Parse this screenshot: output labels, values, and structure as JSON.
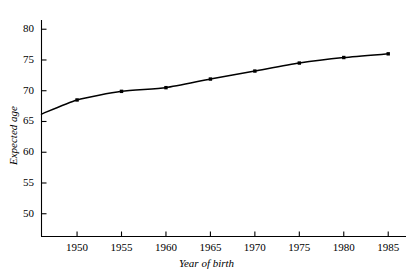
{
  "chart_data": {
    "type": "line",
    "title": "",
    "subtitle": "",
    "xlabel": "Year of birth",
    "ylabel": "Expected age",
    "x": [
      1946,
      1950,
      1955,
      1960,
      1965,
      1970,
      1975,
      1980,
      1985
    ],
    "values": [
      66.2,
      68.5,
      69.9,
      70.5,
      71.9,
      73.2,
      74.5,
      75.4,
      76.0
    ],
    "series": [
      {
        "name": "Expected age",
        "x": [
          1946,
          1950,
          1955,
          1960,
          1965,
          1970,
          1975,
          1980,
          1985
        ],
        "values": [
          66.2,
          68.5,
          69.9,
          70.5,
          71.9,
          73.2,
          74.5,
          75.4,
          76.0
        ],
        "marker": "square",
        "color": "#000000"
      }
    ],
    "xlim": [
      1946,
      1987
    ],
    "ylim": [
      46.3,
      81.5
    ],
    "xticks": [
      1950,
      1955,
      1960,
      1965,
      1970,
      1975,
      1980,
      1985
    ],
    "xtick_labels": [
      "1950",
      "1955",
      "1960",
      "1965",
      "1970",
      "1975",
      "1980",
      "1985"
    ],
    "yticks": [
      50,
      55,
      60,
      65,
      70,
      75,
      80
    ],
    "ytick_labels": [
      "50",
      "55",
      "60",
      "65",
      "70",
      "75",
      "80"
    ],
    "grid": false,
    "legend": null,
    "legend_position": "none",
    "annotations": [],
    "line_color": "#000000",
    "axis_color": "#000000",
    "background_color": "#ffffff"
  }
}
